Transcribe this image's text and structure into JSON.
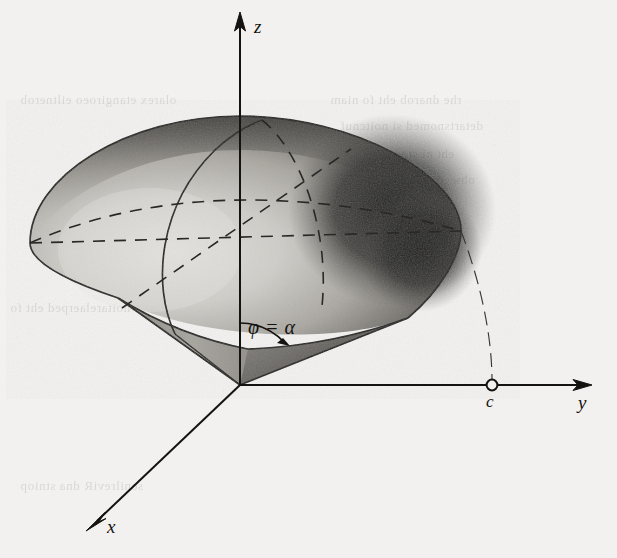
{
  "figure": {
    "background_color": "#f2f1ef",
    "ink_color": "#15130f",
    "axes": {
      "z": {
        "label": "z",
        "origin": [
          240,
          385
        ],
        "tip": [
          240,
          16
        ]
      },
      "y": {
        "label": "y",
        "origin": [
          240,
          385
        ],
        "tip": [
          592,
          385
        ]
      },
      "x": {
        "label": "x",
        "origin": [
          240,
          385
        ],
        "tip": [
          88,
          529
        ]
      }
    },
    "points": [
      {
        "name": "c",
        "label": "c",
        "x": 492,
        "y": 385,
        "marker": "open-circle"
      }
    ],
    "angle": {
      "label": "φ = α",
      "symbol_phi": "φ",
      "symbol_equals": "=",
      "symbol_alpha": "α",
      "vertex": [
        240,
        385
      ],
      "from_axis": "z",
      "to_generator": "cone-edge",
      "degrees": 47
    },
    "shading": {
      "highlight": "#d9d7d2",
      "midtone": "#8e8b85",
      "shadow": "#1b1a19",
      "cone_light": "#b4b1ab",
      "cone_dark": "#3b3936"
    },
    "solid": {
      "name": "ice-cream-cone solid",
      "sphere_radius_label": "c",
      "dome_top": [
        240,
        116
      ],
      "dome_left": [
        30,
        243
      ],
      "dome_right": [
        461,
        231
      ],
      "apex": [
        240,
        385
      ]
    },
    "hidden_lines_style": "dashed",
    "visible_lines_style": "solid",
    "bleed_through_text": [
      "olarex etangiroeo eiltnerob",
      "rhe dnarob eht fo niam",
      "detartsnomed si noitcnuf",
      "eht ni sraeppa taht",
      "ohw ,dnaslaitnereffid",
      "noitarelaerped eht fo",
      "senilreviR dna stniop"
    ]
  }
}
